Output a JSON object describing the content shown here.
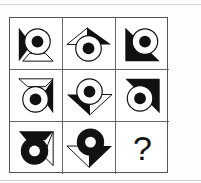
{
  "puzzle": {
    "type": "3x3 matrix reasoning",
    "colors": {
      "ink": "#111111",
      "paper": "#ffffff",
      "grid_line": "#555555"
    },
    "cells": [
      {
        "row": 1,
        "col": 1,
        "description": "ring with black dot; black triangle left, white triangle bottom"
      },
      {
        "row": 1,
        "col": 2,
        "description": "ring with black dot; white triangle upper-left, black triangle upper-right"
      },
      {
        "row": 1,
        "col": 3,
        "description": "ring with black dot; black triangle lower-left corner"
      },
      {
        "row": 2,
        "col": 1,
        "description": "ring with black dot; white triangle top, black triangle right"
      },
      {
        "row": 2,
        "col": 2,
        "description": "ring with black dot; black triangle lower-left, white triangle lower-right"
      },
      {
        "row": 2,
        "col": 3,
        "description": "ring with black dot; black triangle upper-right corner"
      },
      {
        "row": 3,
        "col": 1,
        "description": "black ring with white hole; black triangle top, white triangle right"
      },
      {
        "row": 3,
        "col": 2,
        "description": "black ring with white hole; white triangle lower-left, black triangle lower-right"
      },
      {
        "row": 3,
        "col": 3,
        "description": "missing",
        "label": "?"
      }
    ]
  }
}
